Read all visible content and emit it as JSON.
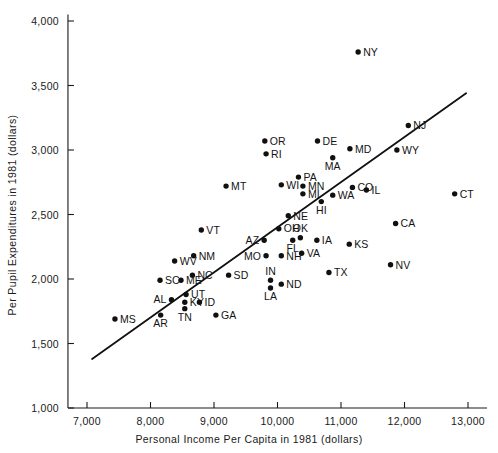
{
  "chart_data": {
    "type": "scatter",
    "title": "",
    "xlabel": "Personal Income Per Capita in 1981 (dollars)",
    "ylabel": "Per Pupil Expenditures in 1981 (dollars)",
    "xlim": [
      6700,
      13300
    ],
    "ylim": [
      1000,
      4050
    ],
    "xticks": [
      7000,
      8000,
      9000,
      10000,
      11000,
      12000,
      13000
    ],
    "xticklabels": [
      "7,000",
      "8,000",
      "9,000",
      "10,000",
      "11,000",
      "12,000",
      "13,000"
    ],
    "yticks": [
      1000,
      1500,
      2000,
      2500,
      3000,
      3500,
      4000
    ],
    "yticklabels": [
      "1,000",
      "1,500",
      "2,000",
      "2,500",
      "3,000",
      "3,500",
      "4,000"
    ],
    "grid": false,
    "legend": null,
    "trendline": {
      "label": "regression line",
      "x_start": 7080,
      "y_start": 1380,
      "x_end": 12970,
      "y_end": 3440
    },
    "points": [
      {
        "label": "NY",
        "x": 11270,
        "y": 3760,
        "label_pos": "right"
      },
      {
        "label": "NJ",
        "x": 12060,
        "y": 3190,
        "label_pos": "right"
      },
      {
        "label": "OR",
        "x": 9800,
        "y": 3070,
        "label_pos": "right"
      },
      {
        "label": "DE",
        "x": 10630,
        "y": 3070,
        "label_pos": "right"
      },
      {
        "label": "MD",
        "x": 11140,
        "y": 3010,
        "label_pos": "right"
      },
      {
        "label": "WY",
        "x": 11880,
        "y": 3000,
        "label_pos": "right"
      },
      {
        "label": "RI",
        "x": 9820,
        "y": 2970,
        "label_pos": "right"
      },
      {
        "label": "MA",
        "x": 10870,
        "y": 2940,
        "label_pos": "below"
      },
      {
        "label": "PA",
        "x": 10330,
        "y": 2790,
        "label_pos": "right"
      },
      {
        "label": "WI",
        "x": 10060,
        "y": 2730,
        "label_pos": "right"
      },
      {
        "label": "MN",
        "x": 10400,
        "y": 2720,
        "label_pos": "right"
      },
      {
        "label": "CO",
        "x": 11180,
        "y": 2710,
        "label_pos": "right"
      },
      {
        "label": "IL",
        "x": 11400,
        "y": 2690,
        "label_pos": "right"
      },
      {
        "label": "MT",
        "x": 9190,
        "y": 2720,
        "label_pos": "right"
      },
      {
        "label": "MI",
        "x": 10400,
        "y": 2660,
        "label_pos": "right"
      },
      {
        "label": "WA",
        "x": 10870,
        "y": 2650,
        "label_pos": "right"
      },
      {
        "label": "CT",
        "x": 12790,
        "y": 2660,
        "label_pos": "right"
      },
      {
        "label": "HI",
        "x": 10690,
        "y": 2600,
        "label_pos": "below"
      },
      {
        "label": "NE",
        "x": 10170,
        "y": 2490,
        "label_pos": "right"
      },
      {
        "label": "CA",
        "x": 11860,
        "y": 2430,
        "label_pos": "right"
      },
      {
        "label": "VT",
        "x": 8800,
        "y": 2380,
        "label_pos": "right"
      },
      {
        "label": "OH",
        "x": 10020,
        "y": 2390,
        "label_pos": "right"
      },
      {
        "label": "AZ",
        "x": 9790,
        "y": 2300,
        "label_pos": "left"
      },
      {
        "label": "OK",
        "x": 10360,
        "y": 2320,
        "label_pos": "above"
      },
      {
        "label": "IA",
        "x": 10620,
        "y": 2300,
        "label_pos": "right"
      },
      {
        "label": "KS",
        "x": 11130,
        "y": 2270,
        "label_pos": "right"
      },
      {
        "label": "FL",
        "x": 10240,
        "y": 2300,
        "label_pos": "below"
      },
      {
        "label": "WV",
        "x": 8380,
        "y": 2140,
        "label_pos": "right"
      },
      {
        "label": "NM",
        "x": 8680,
        "y": 2180,
        "label_pos": "right"
      },
      {
        "label": "MO",
        "x": 9820,
        "y": 2180,
        "label_pos": "left"
      },
      {
        "label": "NH",
        "x": 10060,
        "y": 2180,
        "label_pos": "right"
      },
      {
        "label": "VA",
        "x": 10380,
        "y": 2200,
        "label_pos": "right"
      },
      {
        "label": "NV",
        "x": 11780,
        "y": 2110,
        "label_pos": "right"
      },
      {
        "label": "TX",
        "x": 10810,
        "y": 2050,
        "label_pos": "right"
      },
      {
        "label": "NC",
        "x": 8660,
        "y": 2030,
        "label_pos": "right"
      },
      {
        "label": "SD",
        "x": 9230,
        "y": 2030,
        "label_pos": "right"
      },
      {
        "label": "SC",
        "x": 8150,
        "y": 1990,
        "label_pos": "right"
      },
      {
        "label": "ME",
        "x": 8480,
        "y": 1990,
        "label_pos": "right"
      },
      {
        "label": "IN",
        "x": 9890,
        "y": 1990,
        "label_pos": "above"
      },
      {
        "label": "ND",
        "x": 10060,
        "y": 1960,
        "label_pos": "right"
      },
      {
        "label": "LA",
        "x": 9890,
        "y": 1930,
        "label_pos": "below"
      },
      {
        "label": "UT",
        "x": 8560,
        "y": 1880,
        "label_pos": "right"
      },
      {
        "label": "AL",
        "x": 8330,
        "y": 1840,
        "label_pos": "left"
      },
      {
        "label": "ID",
        "x": 8770,
        "y": 1820,
        "label_pos": "right"
      },
      {
        "label": "KY",
        "x": 8540,
        "y": 1820,
        "label_pos": "right"
      },
      {
        "label": "TN",
        "x": 8540,
        "y": 1770,
        "label_pos": "below"
      },
      {
        "label": "AR",
        "x": 8160,
        "y": 1720,
        "label_pos": "below"
      },
      {
        "label": "GA",
        "x": 9030,
        "y": 1720,
        "label_pos": "right"
      },
      {
        "label": "MS",
        "x": 7440,
        "y": 1690,
        "label_pos": "right"
      }
    ]
  }
}
